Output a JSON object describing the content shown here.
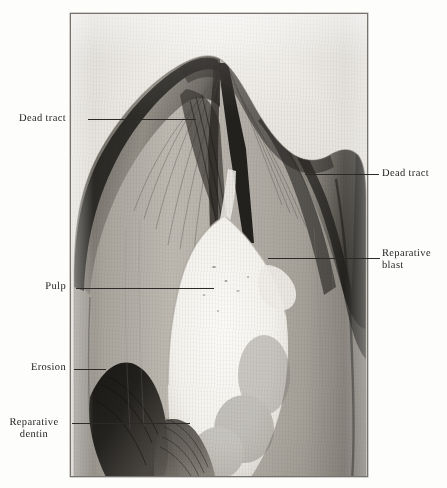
{
  "figure": {
    "kind": "labeled-photomicrograph",
    "plate": {
      "left": 70,
      "top": 13,
      "width": 298,
      "height": 464,
      "border_color": "#77736c",
      "background_color": "#e9e6e0"
    },
    "palette": {
      "paper": "#fdfdfc",
      "slide_background": "#e9e6e0",
      "enamel_mid": "#8f8b83",
      "enamel_dark": "#2b2926",
      "dentin_light": "#b9b5ad",
      "pulp_white": "#f7f6f2",
      "ink": "#1d1c1a",
      "leader": "#2c2a27"
    }
  },
  "annotations": [
    {
      "id": "dead-tract-left",
      "text": "Dead tract",
      "side": "left",
      "label_x": 8,
      "label_y": 113,
      "label_width": 58,
      "leader_x": 88,
      "leader_y": 119,
      "leader_width": 108
    },
    {
      "id": "dead-tract-right",
      "text": "Dead tract",
      "side": "right",
      "label_x": 382,
      "label_y": 174,
      "label_width": 62,
      "leader_x": 305,
      "leader_y": 174,
      "leader_width": 74
    },
    {
      "id": "reparative-blast",
      "text": "Reparative\nblast",
      "side": "right",
      "label_x": 382,
      "label_y": 248,
      "label_width": 62,
      "leader_x": 268,
      "leader_y": 258,
      "leader_width": 112
    },
    {
      "id": "pulp",
      "text": "Pulp",
      "side": "left",
      "label_x": 8,
      "label_y": 281,
      "label_width": 58,
      "leader_x": 76,
      "leader_y": 288,
      "leader_width": 138
    },
    {
      "id": "erosion",
      "text": "Erosion",
      "side": "left",
      "label_x": 8,
      "label_y": 362,
      "label_width": 58,
      "leader_x": 74,
      "leader_y": 369,
      "leader_width": 32
    },
    {
      "id": "reparative-dentin",
      "text": "Reparative\ndentin",
      "side": "left",
      "label_x": 2,
      "label_y": 417,
      "label_width": 64,
      "leader_x": 72,
      "leader_y": 423,
      "leader_width": 118
    }
  ]
}
